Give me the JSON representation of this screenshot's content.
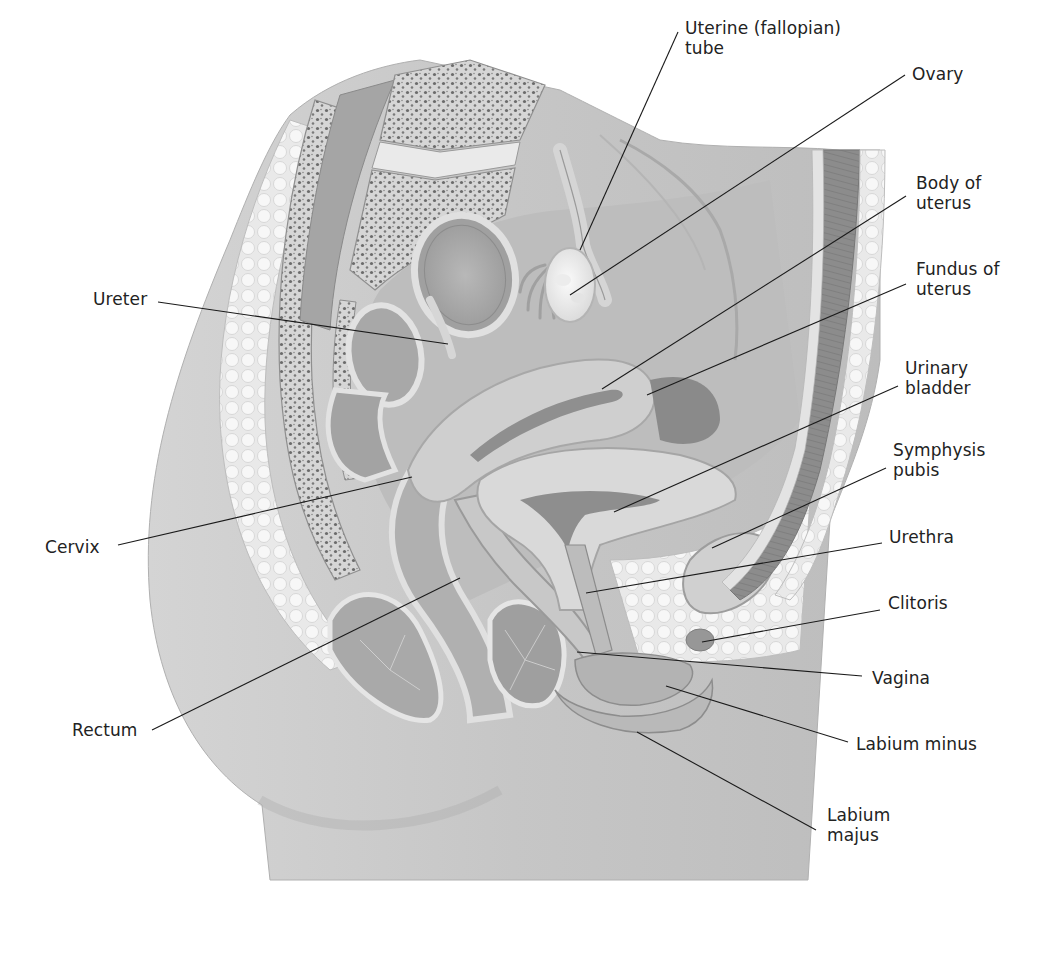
{
  "diagram": {
    "type": "anatomical-illustration",
    "colors": {
      "background": "#ffffff",
      "skin": "#c9c9c9",
      "skin_dark": "#b3b3b3",
      "tissue_light": "#e6e6e6",
      "tissue_mid": "#a9a9a9",
      "tissue_dark": "#7d7d7d",
      "bone_spongy": "#d8d8d8",
      "bone_dots": "#6a6a6a",
      "fat": "#f2f2f2",
      "muscle": "#8a8a8a",
      "label_text": "#222222",
      "leader_line": "#1a1a1a"
    },
    "labels": [
      {
        "id": "uterine-tube",
        "text": "Uterine (fallopian)\ntube",
        "x": 685,
        "y": 18,
        "anchor": [
          678,
          32
        ],
        "target": [
          580,
          250
        ]
      },
      {
        "id": "ovary",
        "text": "Ovary",
        "x": 912,
        "y": 64,
        "anchor": [
          905,
          75
        ],
        "target": [
          570,
          295
        ]
      },
      {
        "id": "body-of-uterus",
        "text": "Body of\nuterus",
        "x": 916,
        "y": 173,
        "anchor": [
          906,
          196
        ],
        "target": [
          602,
          389
        ]
      },
      {
        "id": "fundus-of-uterus",
        "text": "Fundus of\nuterus",
        "x": 916,
        "y": 259,
        "anchor": [
          906,
          284
        ],
        "target": [
          647,
          395
        ]
      },
      {
        "id": "urinary-bladder",
        "text": "Urinary\nbladder",
        "x": 905,
        "y": 358,
        "anchor": [
          898,
          386
        ],
        "target": [
          614,
          512
        ]
      },
      {
        "id": "symphysis-pubis",
        "text": "Symphysis\npubis",
        "x": 893,
        "y": 440,
        "anchor": [
          886,
          468
        ],
        "target": [
          712,
          548
        ]
      },
      {
        "id": "urethra",
        "text": "Urethra",
        "x": 889,
        "y": 527,
        "anchor": [
          882,
          543
        ],
        "target": [
          586,
          593
        ]
      },
      {
        "id": "clitoris",
        "text": "Clitoris",
        "x": 888,
        "y": 593,
        "anchor": [
          880,
          610
        ],
        "target": [
          702,
          642
        ]
      },
      {
        "id": "vagina",
        "text": "Vagina",
        "x": 872,
        "y": 668,
        "anchor": [
          862,
          676
        ],
        "target": [
          577,
          652
        ]
      },
      {
        "id": "labium-minus",
        "text": "Labium minus",
        "x": 856,
        "y": 734,
        "anchor": [
          848,
          742
        ],
        "target": [
          666,
          686
        ]
      },
      {
        "id": "labium-majus",
        "text": "Labium\nmajus",
        "x": 827,
        "y": 805,
        "anchor": [
          816,
          830
        ],
        "target": [
          637,
          732
        ]
      },
      {
        "id": "ureter",
        "text": "Ureter",
        "x": 93,
        "y": 289,
        "anchor": [
          158,
          302
        ],
        "target": [
          448,
          344
        ]
      },
      {
        "id": "cervix",
        "text": "Cervix",
        "x": 45,
        "y": 537,
        "anchor": [
          118,
          545
        ],
        "target": [
          412,
          477
        ]
      },
      {
        "id": "rectum",
        "text": "Rectum",
        "x": 72,
        "y": 720,
        "anchor": [
          152,
          730
        ],
        "target": [
          460,
          578
        ]
      }
    ]
  }
}
